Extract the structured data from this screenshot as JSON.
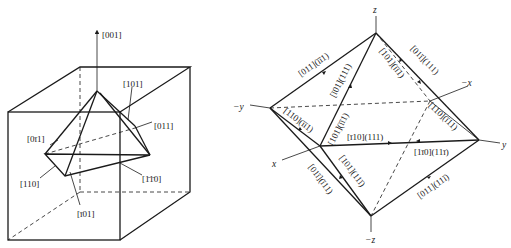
{
  "left_figure": {
    "title": "Cube with pyramid of slip directions",
    "labels": {
      "z_axis": "[001]",
      "top_right": "[101]",
      "right_dashed": "[011]",
      "left": "[0ī1]",
      "left_lower": "[110]",
      "right_lower": "[1̄1̄0]",
      "bottom": "[ī01]"
    },
    "labels_plain": {
      "z_axis": "[001]",
      "top_right": "[101]",
      "right_dashed": "[011]",
      "left": "[0-11]",
      "left_lower": "[110]",
      "right_lower": "[110]",
      "bottom": "[-101]"
    }
  },
  "right_figure": {
    "title": "Octahedron of {111} planes with <110> directions",
    "axes": {
      "z": "z",
      "neg_z": "−z",
      "y": "y",
      "neg_y": "−y",
      "x": "x",
      "neg_x": "−x"
    },
    "edge_labels": {
      "upper_left": "[011](īī1)",
      "upper_mid_left": "[ī01](111)",
      "upper_mid_right": "[101](īī1)",
      "upper_right": "[01ī](111)",
      "mid_left": "[110](īī1)",
      "center_vertical": "[101](īī1)",
      "center_horizontal": "[ī10](111)",
      "mid_right": "[110](ī11)",
      "lower_center_right": "[1ī0](11ī)",
      "lower_left": "[01ī](ī11)",
      "lower_mid_left": "[101](11ī)",
      "lower_right": "[011](11ī)"
    }
  },
  "colors": {
    "ink": "#1a1a1a",
    "background": "#ffffff"
  }
}
